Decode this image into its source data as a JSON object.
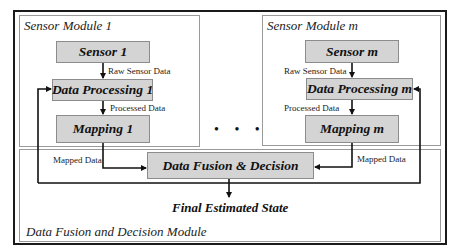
{
  "diagram": {
    "modules": {
      "sensor_module_1": {
        "title": "Sensor Module 1",
        "blocks": [
          "Sensor 1",
          "Data Processing 1",
          "Mapping 1"
        ],
        "edge_labels": [
          "Raw Sensor Data",
          "Processed Data",
          "Mapped Data"
        ]
      },
      "sensor_module_m": {
        "title": "Sensor Module m",
        "blocks": [
          "Sensor m",
          "Data Processing m",
          "Mapping m"
        ],
        "edge_labels": [
          "Raw Sensor Data",
          "Processed Data",
          "Mapped Data"
        ]
      },
      "fusion_module": {
        "title": "Data Fusion and Decision Module",
        "block": "Data Fusion & Decision",
        "output": "Final Estimated State"
      }
    },
    "ellipsis": "• • •",
    "colors": {
      "block_fill": "#d4d4d4",
      "block_border": "#8c8c8c",
      "module_border": "#9a9a9a",
      "frame_border": "#1a1a1a",
      "arrow": "#111111"
    }
  }
}
